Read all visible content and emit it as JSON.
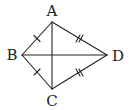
{
  "diagram": {
    "type": "kite",
    "stroke_color": "#222222",
    "vertices": [
      {
        "id": "A",
        "label": "A",
        "x": 52,
        "y": 22,
        "label_x": 52,
        "label_y": 11
      },
      {
        "id": "B",
        "label": "B",
        "x": 22,
        "y": 55,
        "label_x": 12,
        "label_y": 55
      },
      {
        "id": "C",
        "label": "C",
        "x": 52,
        "y": 89,
        "label_x": 52,
        "label_y": 101
      },
      {
        "id": "D",
        "label": "D",
        "x": 107,
        "y": 55,
        "label_x": 118,
        "label_y": 56
      }
    ],
    "edges": [
      {
        "from": "A",
        "to": "B",
        "ticks": 1
      },
      {
        "from": "B",
        "to": "C",
        "ticks": 1
      },
      {
        "from": "A",
        "to": "D",
        "ticks": 2
      },
      {
        "from": "C",
        "to": "D",
        "ticks": 2
      },
      {
        "from": "A",
        "to": "C",
        "ticks": 0
      },
      {
        "from": "B",
        "to": "D",
        "ticks": 0
      }
    ],
    "relations": [
      "AB = BC",
      "AD = CD"
    ]
  }
}
